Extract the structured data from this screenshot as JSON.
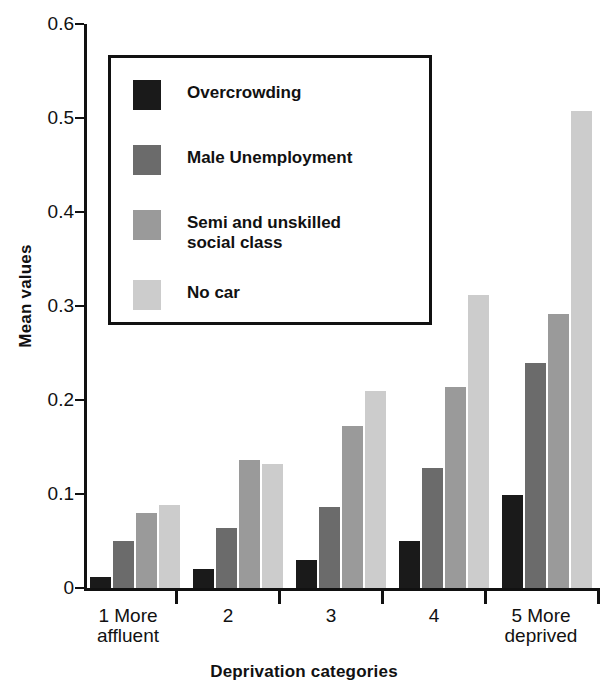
{
  "chart_data": {
    "type": "bar",
    "title": "",
    "xlabel": "Deprivation categories",
    "ylabel": "Mean values",
    "ylim": [
      0,
      0.6
    ],
    "grid": false,
    "legend_position": "upper-left-inset",
    "categories": [
      "1 More\naffluent",
      "2",
      "3",
      "4",
      "5 More\ndeprived"
    ],
    "category_numbers": [
      "1",
      "2",
      "3",
      "4",
      "5"
    ],
    "y_ticks": [
      "0",
      "0.1",
      "0.2",
      "0.3",
      "0.4",
      "0.5",
      "0.6"
    ],
    "y_tick_values": [
      0,
      0.1,
      0.2,
      0.3,
      0.4,
      0.5,
      0.6
    ],
    "series": [
      {
        "name": "Overcrowding",
        "color": "#1a1a1a",
        "values": [
          0.012,
          0.02,
          0.03,
          0.05,
          0.099
        ]
      },
      {
        "name": "Male Unemployment",
        "color": "#6b6b6b",
        "values": [
          0.05,
          0.064,
          0.086,
          0.128,
          0.239
        ]
      },
      {
        "name": "Semi and unskilled\nsocial class",
        "color": "#9a9a9a",
        "values": [
          0.08,
          0.136,
          0.172,
          0.214,
          0.291
        ]
      },
      {
        "name": "No car",
        "color": "#cccccc",
        "values": [
          0.088,
          0.132,
          0.21,
          0.312,
          0.507
        ]
      }
    ]
  },
  "axes": {
    "y_title": "Mean values",
    "x_title": "Deprivation categories",
    "y_tick_0": "0",
    "y_tick_1": "0.1",
    "y_tick_2": "0.2",
    "y_tick_3": "0.3",
    "y_tick_4": "0.4",
    "y_tick_5": "0.5",
    "y_tick_6": "0.6",
    "x_tick_1": "1  More\naffluent",
    "x_tick_2": "2",
    "x_tick_3": "3",
    "x_tick_4": "4",
    "x_tick_5": "5  More\ndeprived"
  },
  "legend": {
    "item_0_label": "Overcrowding",
    "item_1_label": "Male Unemployment",
    "item_2_label": "Semi and unskilled\nsocial class",
    "item_3_label": "No car"
  }
}
